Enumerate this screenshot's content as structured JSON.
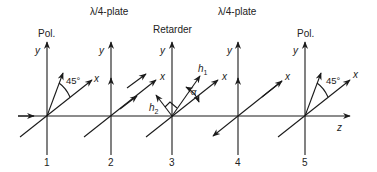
{
  "diagram": {
    "title": "",
    "colors": {
      "line": "#1a1a1a",
      "text": "#222222",
      "background": "#ffffff"
    },
    "z_axis_label": "z",
    "stations": [
      {
        "number": "1",
        "component": "Pol.",
        "y_label": "y",
        "x_label": "x",
        "angle_label": "45°"
      },
      {
        "number": "2",
        "component": "λ/4-plate",
        "y_label": "y",
        "x_label": ""
      },
      {
        "number": "3",
        "component": "Retarder",
        "y_label": "y",
        "x_label": "x",
        "h1_label": "h",
        "h1_sub": "1",
        "h2_label": "h",
        "h2_sub": "2",
        "angle_label": "α"
      },
      {
        "number": "4",
        "component": "λ/4-plate",
        "y_label": "y",
        "x_label": "x"
      },
      {
        "number": "5",
        "component": "Pol.",
        "y_label": "y",
        "x_label": "x",
        "angle_label": "45°"
      }
    ]
  }
}
